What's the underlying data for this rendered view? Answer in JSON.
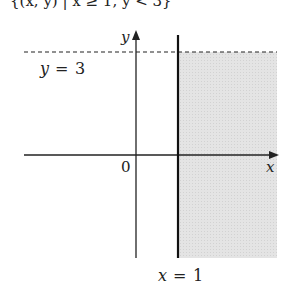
{
  "header_fragment": "{(x, y) | x ≥ 1, y < 3}",
  "diagram": {
    "axes": {
      "x_label": "x",
      "y_label": "y",
      "origin_label": "0"
    },
    "lines": [
      {
        "equation_lhs": "y",
        "equation_op": "=",
        "equation_rhs": "3",
        "style": "dashed"
      },
      {
        "equation_lhs": "x",
        "equation_op": "=",
        "equation_rhs": "1",
        "style": "solid"
      }
    ],
    "region": {
      "description": "x ≥ 1 and y < 3",
      "fill": "#e2e2e2"
    }
  }
}
